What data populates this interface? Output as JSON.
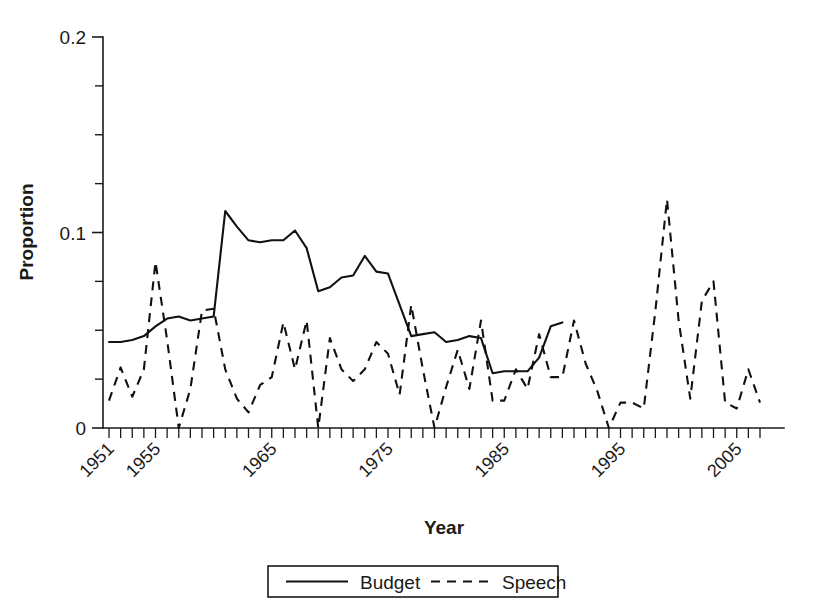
{
  "chart_data": {
    "type": "line",
    "title": "",
    "xlabel": "Year",
    "ylabel": "Proportion",
    "xlim": [
      1951,
      2007
    ],
    "ylim": [
      0,
      0.2
    ],
    "grid": false,
    "legend_position": "bottom-center",
    "y_ticks_major": [
      0,
      0.1,
      0.2
    ],
    "y_tick_labels": [
      "0",
      "0.1",
      "0.2"
    ],
    "y_ticks_minor": [
      0.025,
      0.05,
      0.075,
      0.125,
      0.15,
      0.175
    ],
    "x_tick_labels": [
      "1951",
      "1955",
      "1965",
      "1975",
      "1985",
      "1995",
      "2005"
    ],
    "x_tick_label_years": [
      1951,
      1955,
      1965,
      1975,
      1985,
      1995,
      2005
    ],
    "x_ticks_all_years": true,
    "series": [
      {
        "name": "Budget",
        "style": "solid",
        "x": [
          1951,
          1952,
          1953,
          1954,
          1955,
          1956,
          1957,
          1958,
          1959,
          1960,
          1961,
          1962,
          1963,
          1964,
          1965,
          1966,
          1967,
          1968,
          1969,
          1970,
          1971,
          1972,
          1973,
          1974,
          1975,
          1976,
          1977,
          1978,
          1979,
          1980,
          1981,
          1982,
          1983,
          1984,
          1985,
          1986,
          1987,
          1988,
          1989,
          1990
        ],
        "values": [
          0.044,
          0.044,
          0.045,
          0.047,
          0.052,
          0.056,
          0.057,
          0.055,
          0.056,
          0.057,
          0.111,
          0.103,
          0.096,
          0.095,
          0.096,
          0.096,
          0.101,
          0.092,
          0.07,
          0.072,
          0.077,
          0.078,
          0.088,
          0.08,
          0.079,
          0.063,
          0.047,
          0.048,
          0.049,
          0.044,
          0.045,
          0.047,
          0.046,
          0.028,
          0.029,
          0.029,
          0.029,
          0.036,
          0.052,
          0.054
        ]
      },
      {
        "name": "Speech",
        "style": "dashed",
        "x": [
          1951,
          1952,
          1953,
          1954,
          1955,
          1956,
          1957,
          1958,
          1959,
          1960,
          1961,
          1962,
          1963,
          1964,
          1965,
          1966,
          1967,
          1968,
          1969,
          1970,
          1971,
          1972,
          1973,
          1974,
          1975,
          1976,
          1977,
          1978,
          1979,
          1980,
          1981,
          1982,
          1983,
          1984,
          1985,
          1986,
          1987,
          1988,
          1989,
          1990,
          1991,
          1992,
          1993,
          1994,
          1995,
          1996,
          1997,
          1998,
          1999,
          2000,
          2001,
          2002,
          2003,
          2004,
          2005,
          2006,
          2007
        ],
        "values": [
          0.014,
          0.031,
          0.016,
          0.03,
          0.085,
          0.045,
          0.0,
          0.02,
          0.06,
          0.061,
          0.03,
          0.015,
          0.008,
          0.022,
          0.026,
          0.054,
          0.03,
          0.055,
          0.0,
          0.046,
          0.03,
          0.024,
          0.03,
          0.044,
          0.038,
          0.017,
          0.063,
          0.03,
          0.0,
          0.021,
          0.04,
          0.02,
          0.055,
          0.014,
          0.014,
          0.03,
          0.02,
          0.048,
          0.026,
          0.026,
          0.055,
          0.033,
          0.019,
          0.0,
          0.013,
          0.013,
          0.01,
          0.06,
          0.117,
          0.055,
          0.015,
          0.065,
          0.075,
          0.013,
          0.01,
          0.03,
          0.013
        ]
      }
    ]
  },
  "legend": {
    "entries": [
      {
        "label": "Budget",
        "style": "solid"
      },
      {
        "label": "Speech",
        "style": "dashed"
      }
    ]
  }
}
